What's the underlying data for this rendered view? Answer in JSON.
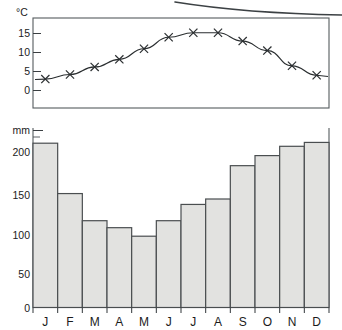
{
  "chart_data": {
    "type": "bar",
    "title": "",
    "subtitle": "",
    "categories": [
      "J",
      "F",
      "M",
      "A",
      "M",
      "J",
      "J",
      "A",
      "S",
      "O",
      "N",
      "D"
    ],
    "month_labels": [
      "J",
      "F",
      "M",
      "A",
      "M",
      "J",
      "J",
      "A",
      "S",
      "O",
      "N",
      "D"
    ],
    "series": [
      {
        "name": "Precipitation",
        "type": "bar",
        "unit": "mm",
        "values": [
          212,
          147,
          112,
          103,
          92,
          112,
          133,
          140,
          183,
          196,
          208,
          213
        ]
      },
      {
        "name": "Temperature",
        "type": "line",
        "unit": "°C",
        "marker": "cross",
        "values": [
          3,
          4.2,
          6.2,
          8.2,
          11,
          14,
          15.2,
          15.2,
          13,
          10.5,
          6.5,
          4
        ]
      }
    ],
    "xlabel": "",
    "ylabel_top": "°C",
    "ylabel_bottom": "mm",
    "ylim_top": [
      -5,
      18
    ],
    "ylim_bottom": [
      0,
      225
    ],
    "yticks_top": [
      15,
      10,
      5,
      0
    ],
    "yticks_bottom": [
      200,
      150,
      100,
      50,
      0
    ],
    "ytick_labels_top": [
      "15",
      "10",
      "5",
      "0"
    ],
    "ytick_labels_bottom": [
      "200",
      "150",
      "100",
      "50",
      "0"
    ],
    "minor_tick_interval_bottom": 10,
    "grid": false,
    "legend": "none"
  },
  "axes": {
    "temperature": {
      "unit_label": "°C",
      "ticks": [
        {
          "value": 15,
          "label": "15"
        },
        {
          "value": 10,
          "label": "10"
        },
        {
          "value": 5,
          "label": "5"
        },
        {
          "value": 0,
          "label": "0"
        }
      ]
    },
    "precipitation": {
      "unit_label": "mm",
      "ticks": [
        {
          "value": 200,
          "label": "200"
        },
        {
          "value": 150,
          "label": "150"
        },
        {
          "value": 100,
          "label": "100"
        },
        {
          "value": 50,
          "label": "50"
        },
        {
          "value": 0,
          "label": "0"
        }
      ]
    }
  },
  "colors": {
    "bar_fill": "#e2e2e0",
    "bar_stroke": "#4a4e50",
    "line_stroke": "#2a2e30",
    "frame": "#555b5e",
    "text": "#1b1b1b",
    "background": "#ffffff"
  },
  "artifacts": {
    "scan_curve_present": true
  }
}
